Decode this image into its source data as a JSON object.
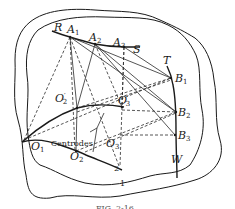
{
  "figure": {
    "caption": "FIG. 2-16",
    "body_labels": {
      "outer": "1",
      "inner": "2"
    },
    "annotation": "Centrodes",
    "points": {
      "R": "R",
      "A1": {
        "base": "A",
        "sub": "1"
      },
      "A2": {
        "base": "A",
        "sub": "2"
      },
      "A3": {
        "base": "A",
        "sub": "3"
      },
      "S": "S",
      "T": "T",
      "B1": {
        "base": "B",
        "sub": "1"
      },
      "B2": {
        "base": "B",
        "sub": "2"
      },
      "B3": {
        "base": "B",
        "sub": "3"
      },
      "W": "W",
      "O1": {
        "base": "O",
        "sub": "1"
      },
      "O2": {
        "base": "O",
        "sub": "2"
      },
      "O3": {
        "base": "O",
        "sub": "3"
      },
      "O2p": {
        "base": "O",
        "sub": "2",
        "prime": "′"
      },
      "O3p": {
        "base": "O",
        "sub": "3",
        "prime": "′"
      }
    },
    "colors": {
      "ink": "#1a1a1a",
      "background": "#ffffff"
    }
  }
}
